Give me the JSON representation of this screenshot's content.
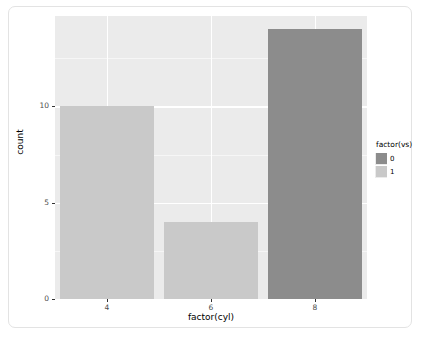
{
  "chart_data": {
    "type": "bar",
    "subtype": "stacked-bar",
    "title": "",
    "xlabel": "factor(cyl)",
    "ylabel": "count",
    "categories": [
      "4",
      "6",
      "8"
    ],
    "series": [
      {
        "name": "0",
        "values": [
          1,
          3,
          14
        ],
        "color": "#8c8c8c"
      },
      {
        "name": "1",
        "values": [
          10,
          4,
          0
        ],
        "color": "#c9c9c9"
      }
    ],
    "totals": [
      11,
      7,
      14
    ],
    "ylim": [
      0,
      14.7
    ],
    "yticks": [
      0,
      5,
      10
    ],
    "yticklabels": [
      "0",
      "5",
      "10"
    ],
    "xticklabels": [
      "4",
      "6",
      "8"
    ],
    "grid": true,
    "legend": {
      "title": "factor(vs)",
      "position": "right",
      "entries": [
        "0",
        "1"
      ]
    },
    "panel_background": "#ebebeb",
    "gridline_color": "#ffffff"
  },
  "legend": {
    "title": "factor(vs)",
    "items": [
      {
        "label": "0",
        "color": "#8c8c8c"
      },
      {
        "label": "1",
        "color": "#c9c9c9"
      }
    ]
  },
  "axes": {
    "y_title": "count",
    "x_title": "factor(cyl)",
    "y_ticks": [
      "10",
      "5",
      "0"
    ],
    "x_ticks": [
      "4",
      "6",
      "8"
    ]
  }
}
